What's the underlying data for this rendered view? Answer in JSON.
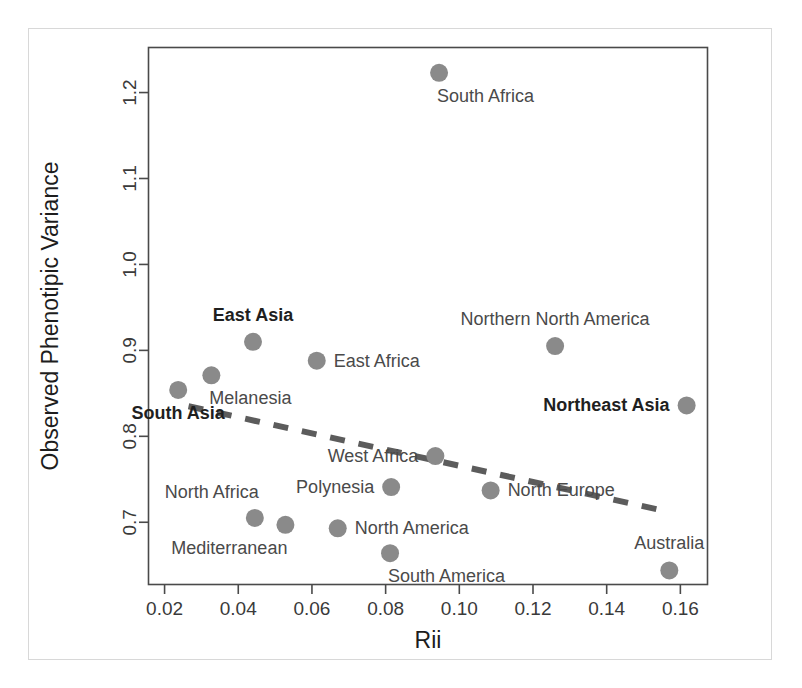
{
  "chart_data": {
    "type": "scatter",
    "title": "",
    "xlabel": "Rii",
    "ylabel": "Observed Phenotipic Variance",
    "xlim": [
      0.0155,
      0.1675
    ],
    "ylim": [
      0.627,
      1.253
    ],
    "xticks": [
      0.02,
      0.04,
      0.06,
      0.08,
      0.1,
      0.12,
      0.14,
      0.16
    ],
    "xticklabels": [
      "0.02",
      "0.04",
      "0.06",
      "0.08",
      "0.10",
      "0.12",
      "0.14",
      "0.16"
    ],
    "yticks": [
      0.7,
      0.8,
      0.9,
      1.0,
      1.1,
      1.2
    ],
    "yticklabels": [
      "0.7",
      "0.8",
      "0.9",
      "1.0",
      "1.1",
      "1.2"
    ],
    "grid": false,
    "legend": "none",
    "marker_color": "#8a8a8a",
    "marker_size": 13,
    "points": [
      {
        "label": "South Africa",
        "x": 0.0945,
        "y": 1.223,
        "bold": false,
        "label_pos": "below-right"
      },
      {
        "label": "East Asia",
        "x": 0.044,
        "y": 0.91,
        "bold": true,
        "label_pos": "above"
      },
      {
        "label": "Northern North America",
        "x": 0.126,
        "y": 0.905,
        "bold": false,
        "label_pos": "above"
      },
      {
        "label": "East Africa",
        "x": 0.0613,
        "y": 0.888,
        "bold": false,
        "label_pos": "right"
      },
      {
        "label": "Melanesia",
        "x": 0.0327,
        "y": 0.871,
        "bold": false,
        "label_pos": "below-right"
      },
      {
        "label": "South Asia",
        "x": 0.0237,
        "y": 0.854,
        "bold": true,
        "label_pos": "below"
      },
      {
        "label": "Northeast Asia",
        "x": 0.1617,
        "y": 0.836,
        "bold": true,
        "label_pos": "left"
      },
      {
        "label": "West Africa",
        "x": 0.0935,
        "y": 0.777,
        "bold": false,
        "label_pos": "left"
      },
      {
        "label": "Polynesia",
        "x": 0.0815,
        "y": 0.741,
        "bold": false,
        "label_pos": "left"
      },
      {
        "label": "North Europe",
        "x": 0.1085,
        "y": 0.737,
        "bold": false,
        "label_pos": "right"
      },
      {
        "label": "North Africa",
        "x": 0.0445,
        "y": 0.705,
        "bold": false,
        "label_pos": "above-left"
      },
      {
        "label": "Mediterranean",
        "x": 0.0528,
        "y": 0.697,
        "bold": false,
        "label_pos": "below-left"
      },
      {
        "label": "North America",
        "x": 0.067,
        "y": 0.693,
        "bold": false,
        "label_pos": "right"
      },
      {
        "label": "South America",
        "x": 0.0812,
        "y": 0.664,
        "bold": false,
        "label_pos": "below-right"
      },
      {
        "label": "Australia",
        "x": 0.157,
        "y": 0.644,
        "bold": false,
        "label_pos": "above"
      }
    ],
    "trendline": {
      "style": "dashed",
      "color": "#5c5c5c",
      "x_start": 0.0265,
      "y_start": 0.835,
      "x_end": 0.157,
      "y_end": 0.712
    }
  }
}
